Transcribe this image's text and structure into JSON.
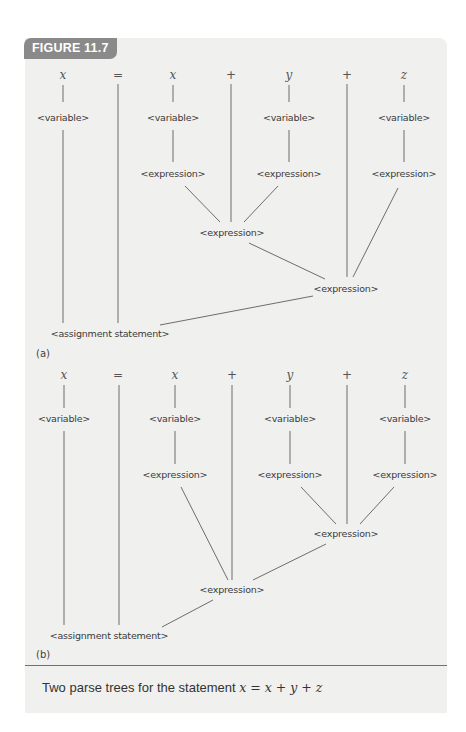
{
  "figure": {
    "label": "FIGURE 11.7",
    "caption_text": "Two parse trees for the statement",
    "caption_math": "x = x + y + z",
    "colors": {
      "panel_bg": "#f0f0ef",
      "tab_bg": "#8a8a8a",
      "tab_text": "#ffffff",
      "line": "#6d6d6d"
    }
  },
  "tokens": [
    "x",
    "=",
    "x",
    "+",
    "y",
    "+",
    "z"
  ],
  "nonterminals": {
    "variable": "<variable>",
    "expression": "<expression>",
    "assignment": "<assignment statement>"
  },
  "trees": [
    {
      "id": "a",
      "label": "(a)",
      "structure": "((x + y) + z)",
      "description": "x = ((x + y) + z): left-associative grouping"
    },
    {
      "id": "b",
      "label": "(b)",
      "structure": "(x + (y + z))",
      "description": "x = (x + (y + z)): right-associative grouping"
    }
  ]
}
